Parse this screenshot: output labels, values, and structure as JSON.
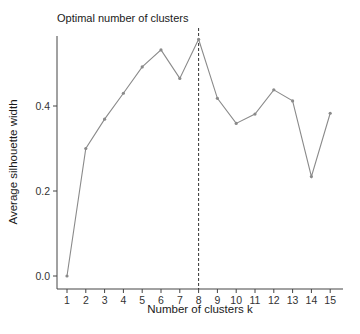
{
  "chart_data": {
    "type": "line",
    "title": "Optimal number of clusters",
    "xlabel": "Number of clusters k",
    "ylabel": "Average silhouette width",
    "x": [
      1,
      2,
      3,
      4,
      5,
      6,
      7,
      8,
      9,
      10,
      11,
      12,
      13,
      14,
      15
    ],
    "categories": [
      "1",
      "2",
      "3",
      "4",
      "5",
      "6",
      "7",
      "8",
      "9",
      "10",
      "11",
      "12",
      "13",
      "14",
      "15"
    ],
    "series": [
      {
        "name": "silhouette",
        "values": [
          0.0,
          0.3,
          0.369,
          0.43,
          0.492,
          0.532,
          0.465,
          0.557,
          0.418,
          0.359,
          0.381,
          0.438,
          0.412,
          0.234,
          0.383
        ],
        "color": "#8a8a8a"
      }
    ],
    "optimal_k": 8,
    "reference_line_color": "#333333",
    "yticks": [
      0.0,
      0.2,
      0.4
    ],
    "ytick_labels": [
      "0.0",
      "0.2",
      "0.4"
    ],
    "ylim": [
      -0.03,
      0.565
    ],
    "xlim": [
      0.45,
      15.7
    ],
    "grid": false,
    "legend": "none"
  }
}
